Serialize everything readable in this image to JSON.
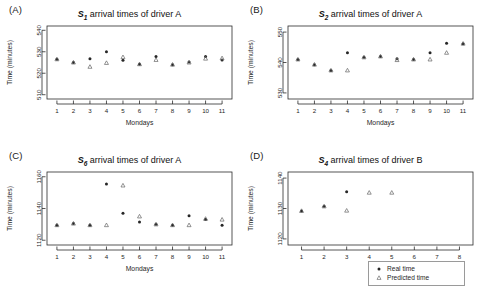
{
  "figure": {
    "background": "#ffffff",
    "point_color_real": "#262626",
    "point_color_pred": "#6e6e6e",
    "axis_color": "#2b2b2b"
  },
  "legend": {
    "name": "series-legend",
    "position": "bottom-right",
    "entries": [
      {
        "glyph": "filled-circle",
        "label": "Real time"
      },
      {
        "glyph": "open-triangle",
        "label": "Predicted time"
      }
    ]
  },
  "panels": [
    {
      "tag": "(A)",
      "series_name": "S",
      "series_sub": "1",
      "title_rest": " arrival times of driver A",
      "full_title": "S1 arrival times of driver A",
      "chart_data": {
        "type": "scatter",
        "title": "S1 arrival times of driver A",
        "xlabel": "Mondays",
        "ylabel": "Time (minutes)",
        "x": [
          1,
          2,
          3,
          4,
          5,
          6,
          7,
          8,
          9,
          10,
          11
        ],
        "xticklabels": [
          "1",
          "2",
          "3",
          "4",
          "5",
          "6",
          "7",
          "8",
          "9",
          "10",
          "11"
        ],
        "xlim": [
          0.4,
          11.6
        ],
        "ylim": [
          508,
          542
        ],
        "yticks": [
          510,
          520,
          530,
          540
        ],
        "yticklabels": [
          "510",
          "520",
          "530",
          "540"
        ],
        "grid": false,
        "series": [
          {
            "name": "Real time",
            "marker": "filled-circle",
            "values": [
              526.5,
              525.0,
              526.8,
              530.0,
              526.0,
              524.2,
              527.8,
              524.0,
              525.2,
              527.8,
              526.2
            ]
          },
          {
            "name": "Predicted time",
            "marker": "open-triangle",
            "values": [
              526.5,
              525.0,
              523.0,
              524.8,
              527.5,
              524.2,
              526.2,
              524.0,
              525.0,
              526.8,
              527.0
            ]
          }
        ]
      }
    },
    {
      "tag": "(B)",
      "series_name": "S",
      "series_sub": "2",
      "title_rest": " arrival times of driver A",
      "full_title": "S2 arrival times of driver A",
      "chart_data": {
        "type": "scatter",
        "title": "S2 arrival times of driver A",
        "xlabel": "Mondays",
        "ylabel": "Time (minutes)",
        "x": [
          1,
          2,
          3,
          4,
          5,
          6,
          7,
          8,
          9,
          10,
          11
        ],
        "xticklabels": [
          "1",
          "2",
          "3",
          "4",
          "5",
          "6",
          "7",
          "8",
          "9",
          "10",
          "11"
        ],
        "xlim": [
          0.4,
          11.6
        ],
        "ylim": [
          528,
          552
        ],
        "yticks": [
          530,
          540,
          550
        ],
        "yticklabels": [
          "530",
          "540",
          "550"
        ],
        "grid": false,
        "series": [
          {
            "name": "Real time",
            "marker": "filled-circle",
            "values": [
              541.0,
              539.3,
              537.4,
              543.2,
              541.7,
              542.0,
              541.2,
              541.0,
              543.2,
              546.3,
              546.2
            ]
          },
          {
            "name": "Predicted time",
            "marker": "open-triangle",
            "values": [
              541.0,
              539.3,
              537.4,
              537.4,
              541.7,
              542.0,
              540.8,
              541.0,
              541.0,
              543.2,
              546.2
            ]
          }
        ]
      }
    },
    {
      "tag": "(C)",
      "series_name": "S",
      "series_sub": "6",
      "title_rest": " arrival times of driver A",
      "full_title": "S6 arrival times of driver A",
      "chart_data": {
        "type": "scatter",
        "title": "S6 arrival times of driver A",
        "xlabel": "Mondays",
        "ylabel": "Time (minutes)",
        "x": [
          1,
          2,
          3,
          4,
          5,
          6,
          7,
          8,
          9,
          10,
          11
        ],
        "xticklabels": [
          "1",
          "2",
          "3",
          "4",
          "5",
          "6",
          "7",
          "8",
          "9",
          "10",
          "11"
        ],
        "xlim": [
          0.4,
          11.6
        ],
        "ylim": [
          1117,
          1163
        ],
        "yticks": [
          1120,
          1140,
          1160
        ],
        "yticklabels": [
          "1120",
          "1140",
          "1160"
        ],
        "grid": false,
        "series": [
          {
            "name": "Real time",
            "marker": "filled-circle",
            "values": [
              1129.5,
              1130.5,
              1129.5,
              1155.5,
              1137.0,
              1131.5,
              1130.0,
              1129.5,
              1135.5,
              1133.0,
              1129.5
            ]
          },
          {
            "name": "Predicted time",
            "marker": "open-triangle",
            "values": [
              1129.5,
              1130.5,
              1129.5,
              1129.5,
              1154.5,
              1135.0,
              1130.0,
              1129.5,
              1129.5,
              1133.5,
              1133.0
            ]
          }
        ]
      }
    },
    {
      "tag": "(D)",
      "series_name": "S",
      "series_sub": "4",
      "title_rest": " arrival times of driver B",
      "full_title": "S4 arrival times of driver B",
      "chart_data": {
        "type": "scatter",
        "title": "S4 arrival times of driver B",
        "xlabel": "Fidays",
        "ylabel": "Time (minutes)",
        "x": [
          1,
          2,
          3,
          4,
          5,
          6,
          7,
          8
        ],
        "xticklabels": [
          "1",
          "2",
          "3",
          "4",
          "5",
          "6",
          "7",
          "8"
        ],
        "xlim": [
          0.4,
          8.6
        ],
        "ylim": [
          1118,
          1142
        ],
        "yticks": [
          1120,
          1130,
          1140
        ],
        "yticklabels": [
          "1120",
          "1130",
          "1140"
        ],
        "grid": false,
        "series": [
          {
            "name": "Real time",
            "marker": "filled-circle",
            "values": [
              1129.2,
              1130.7,
              1135.5,
              null,
              null,
              null,
              null,
              null
            ]
          },
          {
            "name": "Predicted time",
            "marker": "open-triangle",
            "values": [
              1129.2,
              1130.7,
              1129.3,
              1135.2,
              1135.2,
              null,
              null,
              null
            ]
          }
        ]
      }
    }
  ]
}
